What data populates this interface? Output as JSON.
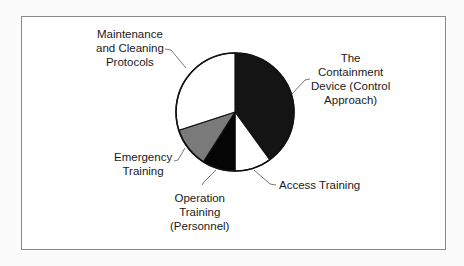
{
  "chart_data": {
    "type": "pie",
    "title": "",
    "start_angle_deg": 0,
    "direction": "clockwise",
    "slices": [
      {
        "label": "The Containment Device (Control Approach)",
        "value": 40,
        "color": "#141414"
      },
      {
        "label": "Access Training",
        "value": 10,
        "color": "#ffffff"
      },
      {
        "label": "Operation Training (Personnel)",
        "value": 9,
        "color": "#050505"
      },
      {
        "label": "Emergency Training",
        "value": 11,
        "color": "#7a7a7a"
      },
      {
        "label": "Maintenance and Cleaning Protocols",
        "value": 30,
        "color": "#ffffff"
      }
    ],
    "legend": "none (callout labels)"
  },
  "labels": {
    "containment": [
      "The",
      "Containment",
      "Device (Control",
      "Approach)"
    ],
    "access": [
      "Access Training"
    ],
    "operation": [
      "Operation",
      "Training",
      "(Personnel)"
    ],
    "emergency": [
      "Emergency",
      "Training"
    ],
    "maintenance": [
      "Maintenance",
      "and Cleaning",
      "Protocols"
    ]
  }
}
